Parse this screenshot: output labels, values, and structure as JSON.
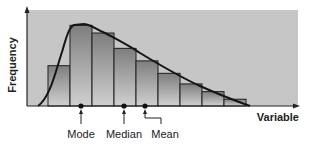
{
  "chart_data": {
    "type": "bar",
    "title": "",
    "xlabel": "Variable",
    "ylabel": "Frequency",
    "categories": [
      "1",
      "2",
      "3",
      "4",
      "5",
      "6",
      "7",
      "8",
      "9"
    ],
    "values": [
      42,
      84,
      76,
      60,
      47,
      34,
      23,
      15,
      7
    ],
    "ylim": [
      0,
      100
    ],
    "grid": false,
    "legend": null,
    "overlay_curve": "right-skewed density curve",
    "annotations": [
      {
        "label": "Mode",
        "x_bin": 2.0
      },
      {
        "label": "Median",
        "x_bin": 3.9
      },
      {
        "label": "Mean",
        "x_bin": 4.9
      }
    ]
  },
  "axes": {
    "x_label": "Variable",
    "y_label": "Frequency"
  },
  "markers": {
    "mode": "Mode",
    "median": "Median",
    "mean": "Mean"
  },
  "colors": {
    "plot_bg": "#c8c8c8",
    "bar_top": "#8a8a8a",
    "bar_bottom": "#d4d4d4",
    "line": "#1a1a1a"
  }
}
